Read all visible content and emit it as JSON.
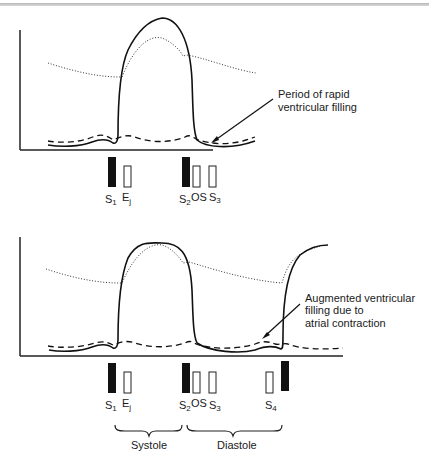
{
  "panels": [
    {
      "name": "normal",
      "annotation": [
        "Period of rapid",
        "ventricular filling"
      ],
      "sounds": [
        {
          "base": "S",
          "sub": "1",
          "fill": "solid"
        },
        {
          "base": "E",
          "sub": "j",
          "fill": "open"
        },
        {
          "base": "S",
          "sub": "2",
          "fill": "solid"
        },
        {
          "base": "OS",
          "sub": "",
          "fill": "open"
        },
        {
          "base": "S",
          "sub": "3",
          "fill": "open"
        }
      ]
    },
    {
      "name": "augmented",
      "annotation": [
        "Augmented ventricular",
        "filling due to",
        "atrial contraction"
      ],
      "sounds": [
        {
          "base": "S",
          "sub": "1",
          "fill": "solid"
        },
        {
          "base": "E",
          "sub": "j",
          "fill": "open"
        },
        {
          "base": "S",
          "sub": "2",
          "fill": "solid"
        },
        {
          "base": "OS",
          "sub": "",
          "fill": "open"
        },
        {
          "base": "S",
          "sub": "3",
          "fill": "open"
        },
        {
          "base": "S",
          "sub": "4",
          "fill": "open"
        }
      ]
    }
  ],
  "phases": {
    "systole": "Systole",
    "diastole": "Diastole"
  },
  "legend_lines": {
    "solid": "ventricular pressure",
    "dotted": "aortic pressure",
    "dashed": "atrial pressure"
  }
}
